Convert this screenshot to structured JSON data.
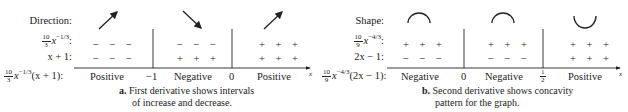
{
  "panel_a": {
    "row_labels": {
      "direction": "Direction:",
      "factor1_num": "10",
      "factor1_den": "3",
      "factor1_var": "x",
      "factor1_exp": "−1/3",
      "factor2": "x + 1:",
      "product_num": "10",
      "product_den": "3",
      "product_var": "x",
      "product_exp": "−1/3",
      "product_tail": "(x + 1):"
    },
    "direction_icons": [
      "arrow-up-right",
      "arrow-down-right",
      "arrow-up-right"
    ],
    "factor1_signs": [
      "− − −",
      "− − −",
      "+ + +"
    ],
    "factor2_signs": [
      "− − −",
      "+ + +",
      "+ + +"
    ],
    "results": [
      "Positive",
      "Negative",
      "Positive"
    ],
    "critical_points": [
      "−1",
      "0"
    ],
    "axis_label": "x",
    "caption_bold": "a.",
    "caption_line1": " First derivative shows intervals",
    "caption_line2": "of increase and decrease."
  },
  "panel_b": {
    "row_labels": {
      "shape": "Shape:",
      "factor1_num": "10",
      "factor1_den": "9",
      "factor1_var": "x",
      "factor1_exp": "−4/3",
      "factor2": "2x − 1:",
      "product_num": "10",
      "product_den": "9",
      "product_var": "x",
      "product_exp": "−4/3",
      "product_tail": "(2x − 1):"
    },
    "shape_icons": [
      "concave-down-arc",
      "concave-down-arc",
      "concave-up-arc"
    ],
    "factor1_signs": [
      "+ + +",
      "+ + +",
      "+ + +"
    ],
    "factor2_signs": [
      "− − −",
      "− − −",
      "+ + +"
    ],
    "results": [
      "Negative",
      "Negative",
      "Positive"
    ],
    "critical_points": [
      "0",
      "1",
      "2"
    ],
    "axis_label": "x",
    "caption_bold": "b.",
    "caption_line1": " Second derivative shows concavity",
    "caption_line2": "pattern for the graph."
  }
}
